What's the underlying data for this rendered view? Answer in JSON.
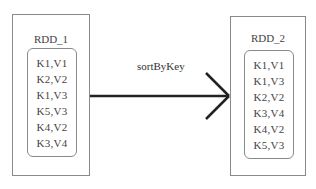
{
  "rdd1": {
    "title": "RDD_1",
    "items": [
      "K1,V1",
      "K2,V2",
      "K1,V3",
      "K5,V3",
      "K4,V2",
      "K3,V4"
    ]
  },
  "rdd2": {
    "title": "RDD_2",
    "items": [
      "K1,V1",
      "K1,V3",
      "K2,V2",
      "K3,V4",
      "K4,V2",
      "K5,V3"
    ]
  },
  "transformation": {
    "label": "sortByKey"
  }
}
